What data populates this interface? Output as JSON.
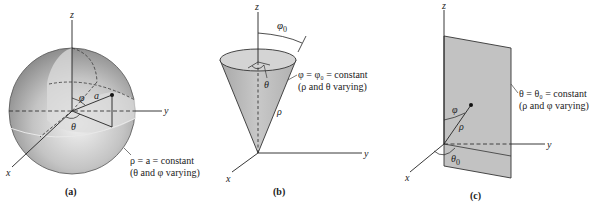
{
  "figure": {
    "panels": [
      {
        "id": "a",
        "caption": "(a)",
        "surface": "sphere",
        "axes": {
          "z": "z",
          "y": "y",
          "x": "x"
        },
        "angle_labels": {
          "phi": "φ",
          "theta": "θ",
          "radius": "a"
        },
        "description_line1": "ρ = a = constant",
        "description_line2": "(θ and φ varying)"
      },
      {
        "id": "b",
        "caption": "(b)",
        "surface": "cone",
        "axes": {
          "z": "z",
          "y": "y",
          "x": "x"
        },
        "angle_labels": {
          "phi0": "φ",
          "phi0_sub": "0",
          "theta": "θ",
          "rho": "ρ"
        },
        "description_line1": "φ = φ₀ = constant",
        "description_line2": "(ρ and θ varying)"
      },
      {
        "id": "c",
        "caption": "(c)",
        "surface": "half-plane",
        "axes": {
          "z": "z",
          "y": "y",
          "x": "x"
        },
        "angle_labels": {
          "phi": "φ",
          "rho": "ρ",
          "theta0": "θ",
          "theta0_sub": "0"
        },
        "description_line1": "θ = θ₀ = constant",
        "description_line2": "(ρ and φ varying)"
      }
    ],
    "colors": {
      "surface_gray": "#b8b8b8",
      "surface_light": "#d9d9d9",
      "line": "#222222"
    }
  }
}
